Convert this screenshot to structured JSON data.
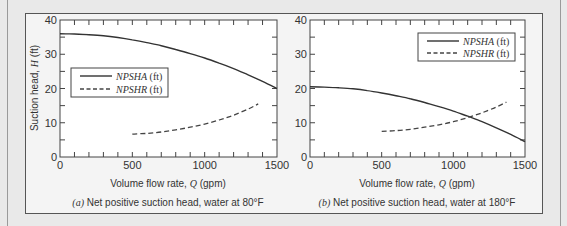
{
  "chart_data": [
    {
      "type": "line",
      "panel": "a",
      "title": "(a) Net positive suction head, water at 80°F",
      "caption_prefix": "(a)",
      "caption_text": "Net positive suction head, water at 80°F",
      "xlabel": "Volume flow rate, Q (gpm)",
      "ylabel": "Suction head, H (ft)",
      "xlim": [
        0,
        1500
      ],
      "ylim": [
        0,
        40
      ],
      "xticks": [
        0,
        500,
        1000,
        1500
      ],
      "yticks": [
        0,
        10,
        20,
        30,
        40
      ],
      "minor_xtick_step": 100,
      "minor_ytick_step": 5,
      "grid": false,
      "legend_position": "center-left",
      "series": [
        {
          "name": "NPSHA (ft)",
          "style": "solid",
          "x": [
            0,
            100,
            200,
            300,
            400,
            500,
            600,
            700,
            800,
            900,
            1000,
            1100,
            1200,
            1300,
            1400,
            1500
          ],
          "values": [
            36.0,
            35.9,
            35.7,
            35.4,
            34.9,
            34.2,
            33.4,
            32.5,
            31.4,
            30.2,
            28.9,
            27.4,
            25.8,
            24.0,
            22.1,
            20.0
          ]
        },
        {
          "name": "NPSHR (ft)",
          "style": "dashed",
          "x": [
            500,
            600,
            700,
            800,
            900,
            1000,
            1100,
            1200,
            1300,
            1370
          ],
          "values": [
            6.7,
            6.9,
            7.3,
            7.9,
            8.7,
            9.6,
            10.8,
            12.2,
            14.0,
            15.5
          ]
        }
      ]
    },
    {
      "type": "line",
      "panel": "b",
      "title": "(b) Net positive suction head, water at 180°F",
      "caption_prefix": "(b)",
      "caption_text": "Net positive suction head, water at 180°F",
      "xlabel": "Volume flow rate, Q (gpm)",
      "ylabel": "",
      "xlim": [
        0,
        1500
      ],
      "ylim": [
        0,
        40
      ],
      "xticks": [
        0,
        500,
        1000,
        1500
      ],
      "yticks": [
        0,
        10,
        20,
        30,
        40
      ],
      "minor_xtick_step": 100,
      "minor_ytick_step": 5,
      "grid": false,
      "legend_position": "upper-right",
      "series": [
        {
          "name": "NPSHA (ft)",
          "style": "solid",
          "x": [
            0,
            100,
            200,
            300,
            400,
            500,
            600,
            700,
            800,
            900,
            1000,
            1100,
            1200,
            1300,
            1400,
            1500
          ],
          "values": [
            20.5,
            20.4,
            20.2,
            19.9,
            19.4,
            18.7,
            17.9,
            17.0,
            15.9,
            14.7,
            13.4,
            11.9,
            10.3,
            8.5,
            6.6,
            4.5
          ]
        },
        {
          "name": "NPSHR (ft)",
          "style": "dashed",
          "x": [
            500,
            600,
            700,
            800,
            900,
            1000,
            1100,
            1200,
            1300,
            1370
          ],
          "values": [
            7.5,
            7.7,
            8.1,
            8.7,
            9.4,
            10.3,
            11.5,
            12.9,
            14.6,
            16.0
          ]
        }
      ]
    }
  ],
  "legend": {
    "npsha_italic": "NPSHA",
    "npshr_italic": "NPSHR",
    "unit": " (ft)"
  },
  "axis": {
    "xlabel_prefix": "Volume flow rate, ",
    "xlabel_var": "Q",
    "xlabel_suffix": " (gpm)",
    "ylabel_prefix": "Suction head, ",
    "ylabel_var": "H",
    "ylabel_suffix": " (ft)"
  },
  "tick_labels": {
    "x": [
      "0",
      "500",
      "1000",
      "1500"
    ],
    "y": [
      "0",
      "10",
      "20",
      "30",
      "40"
    ]
  }
}
